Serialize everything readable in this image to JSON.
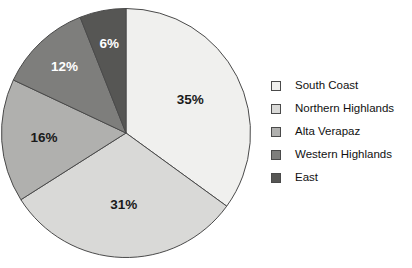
{
  "chart_data": {
    "type": "pie",
    "title": "",
    "subtitle": "",
    "xlabel": "",
    "ylabel": "",
    "grid": false,
    "legend_position": "right",
    "start_angle_deg": 0,
    "direction": "clockwise",
    "value_unit": "%",
    "categories": [
      "South Coast",
      "Northern Highlands",
      "Alta Verapaz",
      "Western Highlands",
      "East"
    ],
    "values": [
      35,
      31,
      16,
      12,
      6
    ],
    "data_labels": [
      "35%",
      "31%",
      "16%",
      "12%",
      "6%"
    ],
    "slice_colors": [
      "#f0f0ee",
      "#d9d9d7",
      "#b0b0ae",
      "#7e7e7c",
      "#565654"
    ],
    "slice_label_colors": [
      "#1a1a1a",
      "#1a1a1a",
      "#1a1a1a",
      "#ffffff",
      "#ffffff"
    ],
    "stroke_color": "#4a4a4a",
    "slices": [
      {
        "label": "South Coast",
        "value": 35,
        "data_label": "35%",
        "color": "#f0f0ee",
        "label_color": "dark"
      },
      {
        "label": "Northern Highlands",
        "value": 31,
        "data_label": "31%",
        "color": "#d9d9d7",
        "label_color": "dark"
      },
      {
        "label": "Alta Verapaz",
        "value": 16,
        "data_label": "16%",
        "color": "#b0b0ae",
        "label_color": "dark"
      },
      {
        "label": "Western Highlands",
        "value": 12,
        "data_label": "12%",
        "color": "#7e7e7c",
        "label_color": "light"
      },
      {
        "label": "East",
        "value": 6,
        "data_label": "6%",
        "color": "#565654",
        "label_color": "light"
      }
    ]
  },
  "legend": {
    "items": [
      {
        "label": "South Coast",
        "color": "#f0f0ee"
      },
      {
        "label": "Northern Highlands",
        "color": "#d9d9d7"
      },
      {
        "label": "Alta Verapaz",
        "color": "#b0b0ae"
      },
      {
        "label": "Western Highlands",
        "color": "#7e7e7c"
      },
      {
        "label": "East",
        "color": "#565654"
      }
    ]
  }
}
